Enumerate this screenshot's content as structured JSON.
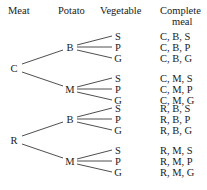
{
  "headers": [
    {
      "label": "Meat",
      "x": 8,
      "y": 10,
      "align": "left"
    },
    {
      "label": "Potato",
      "x": 58,
      "y": 10,
      "align": "left"
    },
    {
      "label": "Vegetable",
      "x": 100,
      "y": 10,
      "align": "left"
    },
    {
      "label": "Complete",
      "x": 160,
      "y": 10,
      "align": "left"
    },
    {
      "label": "meal",
      "x": 172,
      "y": 21,
      "align": "left"
    }
  ],
  "columns": {
    "meat": "Meat",
    "potato": "Potato",
    "vegetable": "Vegetable",
    "complete_meal_line1": "Complete",
    "complete_meal_line2": "meal"
  },
  "style": {
    "line_color": "#3a3a3a",
    "text_color": "#1a1a1a",
    "background": "#ffffff"
  },
  "nodes": {
    "roots": [
      {
        "label": "C",
        "x": 14,
        "y": 68
      },
      {
        "label": "R",
        "x": 14,
        "y": 140
      }
    ],
    "potatoes": [
      {
        "label": "B",
        "x": 70,
        "y": 47,
        "parent": "C"
      },
      {
        "label": "M",
        "x": 70,
        "y": 89,
        "parent": "C"
      },
      {
        "label": "B",
        "x": 70,
        "y": 119,
        "parent": "R"
      },
      {
        "label": "M",
        "x": 70,
        "y": 161,
        "parent": "R"
      }
    ],
    "vegetables": [
      {
        "label": "S",
        "x": 118,
        "y": 36
      },
      {
        "label": "P",
        "x": 118,
        "y": 47
      },
      {
        "label": "G",
        "x": 118,
        "y": 58
      },
      {
        "label": "S",
        "x": 118,
        "y": 78
      },
      {
        "label": "P",
        "x": 118,
        "y": 89
      },
      {
        "label": "G",
        "x": 118,
        "y": 100
      },
      {
        "label": "S",
        "x": 118,
        "y": 108
      },
      {
        "label": "P",
        "x": 118,
        "y": 119
      },
      {
        "label": "G",
        "x": 118,
        "y": 130
      },
      {
        "label": "S",
        "x": 118,
        "y": 150
      },
      {
        "label": "P",
        "x": 118,
        "y": 161
      },
      {
        "label": "G",
        "x": 118,
        "y": 172
      }
    ]
  },
  "meals": [
    {
      "label": "C, B, S",
      "x": 160,
      "y": 36
    },
    {
      "label": "C, B, P",
      "x": 160,
      "y": 47
    },
    {
      "label": "C, B, G",
      "x": 160,
      "y": 58
    },
    {
      "label": "C, M, S",
      "x": 160,
      "y": 78
    },
    {
      "label": "C, M, P",
      "x": 160,
      "y": 89
    },
    {
      "label": "C, M, G",
      "x": 160,
      "y": 100
    },
    {
      "label": "R, B, S",
      "x": 160,
      "y": 108
    },
    {
      "label": "R, B, P",
      "x": 160,
      "y": 119
    },
    {
      "label": "R, B, G",
      "x": 160,
      "y": 130
    },
    {
      "label": "R, M, S",
      "x": 160,
      "y": 150
    },
    {
      "label": "R, M, P",
      "x": 160,
      "y": 161
    },
    {
      "label": "R, M, G",
      "x": 160,
      "y": 172
    }
  ],
  "edges": [
    {
      "x1": 22,
      "y1": 64,
      "x2": 63,
      "y2": 50
    },
    {
      "x1": 22,
      "y1": 72,
      "x2": 63,
      "y2": 86
    },
    {
      "x1": 22,
      "y1": 136,
      "x2": 63,
      "y2": 122
    },
    {
      "x1": 22,
      "y1": 144,
      "x2": 63,
      "y2": 158
    },
    {
      "x1": 77,
      "y1": 45,
      "x2": 112,
      "y2": 36
    },
    {
      "x1": 77,
      "y1": 47,
      "x2": 112,
      "y2": 47
    },
    {
      "x1": 77,
      "y1": 50,
      "x2": 112,
      "y2": 58
    },
    {
      "x1": 77,
      "y1": 87,
      "x2": 112,
      "y2": 78
    },
    {
      "x1": 77,
      "y1": 89,
      "x2": 112,
      "y2": 89
    },
    {
      "x1": 77,
      "y1": 92,
      "x2": 112,
      "y2": 100
    },
    {
      "x1": 77,
      "y1": 117,
      "x2": 112,
      "y2": 108
    },
    {
      "x1": 77,
      "y1": 119,
      "x2": 112,
      "y2": 119
    },
    {
      "x1": 77,
      "y1": 122,
      "x2": 112,
      "y2": 130
    },
    {
      "x1": 77,
      "y1": 159,
      "x2": 112,
      "y2": 150
    },
    {
      "x1": 77,
      "y1": 161,
      "x2": 112,
      "y2": 161
    },
    {
      "x1": 77,
      "y1": 164,
      "x2": 112,
      "y2": 172
    }
  ]
}
